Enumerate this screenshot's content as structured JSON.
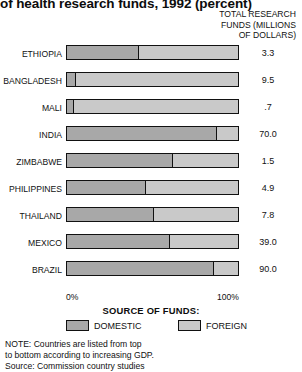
{
  "title": "of health research funds, 1992 (percent)",
  "value_header": {
    "line1": "TOTAL RESEARCH",
    "line2": "FUNDS (MILLIONS",
    "line3": "OF DOLLARS)"
  },
  "axis": {
    "min_label": "0%",
    "max_label": "100%"
  },
  "legend": {
    "title": "SOURCE OF FUNDS:",
    "domestic_label": "DOMESTIC",
    "foreign_label": "FOREIGN"
  },
  "footnote": {
    "line1": "NOTE: Countries are listed from top",
    "line2": "to bottom according to increasing GDP.",
    "line3": "Source: Commission country studies"
  },
  "colors": {
    "domestic": "#a8a8a8",
    "foreign": "#c9c9c9",
    "outline": "#111111",
    "background": "#ffffff"
  },
  "chart_data": {
    "type": "bar",
    "orientation": "horizontal",
    "stacked": true,
    "title": "of health research funds, 1992 (percent)",
    "xlabel": "",
    "ylabel": "",
    "xlim": [
      0,
      100
    ],
    "grid": false,
    "legend_position": "bottom",
    "categories": [
      "ETHIOPIA",
      "BANGLADESH",
      "MALI",
      "INDIA",
      "ZIMBABWE",
      "PHILIPPINES",
      "THAILAND",
      "MEXICO",
      "BRAZIL"
    ],
    "series": [
      {
        "name": "DOMESTIC",
        "values": [
          42,
          5,
          4,
          88,
          62,
          46,
          51,
          60,
          86
        ]
      },
      {
        "name": "FOREIGN",
        "values": [
          58,
          95,
          96,
          12,
          38,
          54,
          49,
          40,
          14
        ]
      }
    ],
    "annotations": {
      "column_header": "TOTAL RESEARCH FUNDS (MILLIONS OF DOLLARS)",
      "values": [
        "3.3",
        "9.5",
        ".7",
        "70.0",
        "1.5",
        "4.9",
        "7.8",
        "39.0",
        "90.0"
      ]
    },
    "rows": [
      {
        "label": "ETHIOPIA",
        "domestic": 42,
        "foreign": 58,
        "total_funds": "3.3"
      },
      {
        "label": "BANGLADESH",
        "domestic": 5,
        "foreign": 95,
        "total_funds": "9.5"
      },
      {
        "label": "MALI",
        "domestic": 4,
        "foreign": 96,
        "total_funds": ".7"
      },
      {
        "label": "INDIA",
        "domestic": 88,
        "foreign": 12,
        "total_funds": "70.0"
      },
      {
        "label": "ZIMBABWE",
        "domestic": 62,
        "foreign": 38,
        "total_funds": "1.5"
      },
      {
        "label": "PHILIPPINES",
        "domestic": 46,
        "foreign": 54,
        "total_funds": "4.9"
      },
      {
        "label": "THAILAND",
        "domestic": 51,
        "foreign": 49,
        "total_funds": "7.8"
      },
      {
        "label": "MEXICO",
        "domestic": 60,
        "foreign": 40,
        "total_funds": "39.0"
      },
      {
        "label": "BRAZIL",
        "domestic": 86,
        "foreign": 14,
        "total_funds": "90.0"
      }
    ]
  }
}
